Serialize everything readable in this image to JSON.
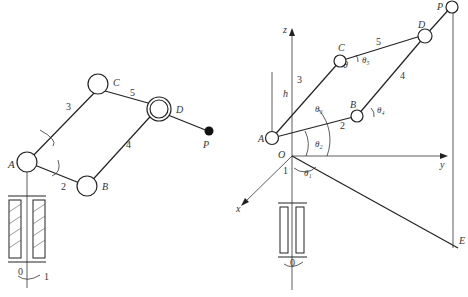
{
  "left_figure": {
    "joints": [
      "A",
      "B",
      "C",
      "D"
    ],
    "point": "P",
    "links": [
      "2",
      "3",
      "4",
      "5"
    ],
    "base_labels": [
      "0",
      "1"
    ]
  },
  "right_figure": {
    "joints": [
      "A",
      "B",
      "C",
      "D"
    ],
    "points": [
      "O",
      "P",
      "E"
    ],
    "links": [
      "1",
      "2",
      "3",
      "4",
      "5"
    ],
    "axes": [
      "x",
      "y",
      "z"
    ],
    "offset": "h",
    "angles": [
      "θ1",
      "θ2",
      "θ3",
      "θ4",
      "θ5"
    ],
    "base_labels": [
      "0"
    ]
  }
}
